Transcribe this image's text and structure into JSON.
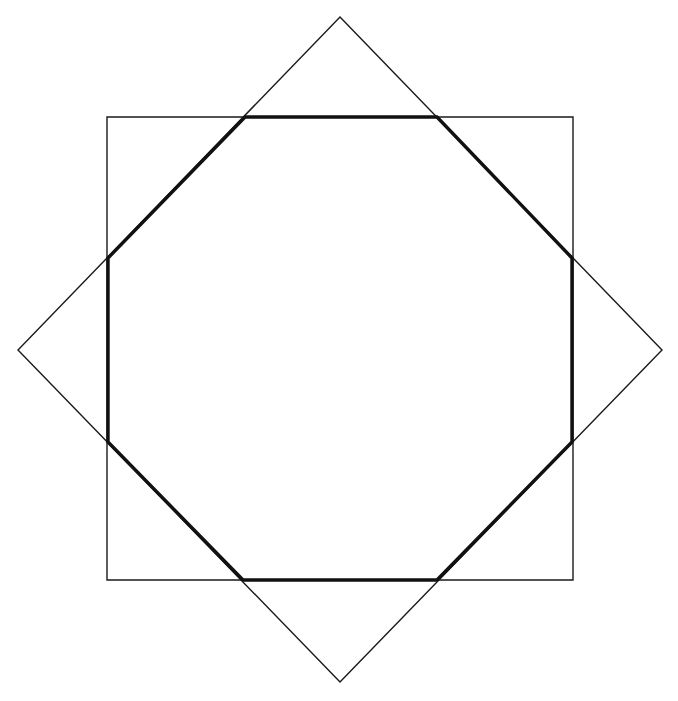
{
  "document": {
    "title": "Two Overlapping Squares Forming a Regular Octagon",
    "background_color": "#ffffff",
    "width": 678,
    "height": 701
  },
  "chart_data": {
    "type": "diagram",
    "subtitle": "",
    "xlabel": "",
    "ylabel": "",
    "grid": false,
    "legend": "none",
    "xlim": [
      0,
      678
    ],
    "ylim": [
      0,
      701
    ],
    "annotations": [],
    "center": {
      "x": 340,
      "y": 349
    },
    "shapes": [
      {
        "name": "axis-aligned-square",
        "kind": "polygon",
        "closed": true,
        "stroke_color": "#1a1a1a",
        "stroke_width": 1.4,
        "fill": "none",
        "rotation_deg": 0,
        "points": [
          {
            "x": 107,
            "y": 117
          },
          {
            "x": 573,
            "y": 117
          },
          {
            "x": 573,
            "y": 580
          },
          {
            "x": 107,
            "y": 580
          }
        ]
      },
      {
        "name": "rotated-square-diamond",
        "kind": "polygon",
        "closed": true,
        "stroke_color": "#1a1a1a",
        "stroke_width": 1.4,
        "fill": "none",
        "rotation_deg": 45,
        "points": [
          {
            "x": 340,
            "y": 17
          },
          {
            "x": 662,
            "y": 350
          },
          {
            "x": 340,
            "y": 682
          },
          {
            "x": 18,
            "y": 350
          }
        ]
      },
      {
        "name": "intersection-octagon",
        "kind": "polygon",
        "closed": true,
        "stroke_color": "#111111",
        "stroke_width": 3.4,
        "fill": "none",
        "rotation_deg": 0,
        "points": [
          {
            "x": 245,
            "y": 117
          },
          {
            "x": 437,
            "y": 117
          },
          {
            "x": 572,
            "y": 258
          },
          {
            "x": 572,
            "y": 442
          },
          {
            "x": 437,
            "y": 580
          },
          {
            "x": 243,
            "y": 580
          },
          {
            "x": 108,
            "y": 442
          },
          {
            "x": 108,
            "y": 258
          }
        ]
      }
    ]
  }
}
